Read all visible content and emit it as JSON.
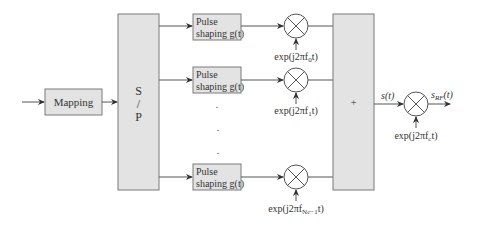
{
  "diagram": {
    "blocks": {
      "mapping": "Mapping",
      "sp": {
        "line1": "S",
        "line2": "/",
        "line3": "P"
      },
      "sum": "+"
    },
    "pulse_shaping": [
      {
        "line1": "Pulse",
        "line2": "shaping g(t)"
      },
      {
        "line1": "Pulse",
        "line2": "shaping g(t)"
      },
      {
        "line1": "Pulse",
        "line2": "shaping g(t)"
      }
    ],
    "carriers": [
      {
        "label": "exp(j2πf",
        "sub": "0",
        "tail": "t)"
      },
      {
        "label": "exp(j2πf",
        "sub": "1",
        "tail": "t)"
      },
      {
        "label": "exp(j2πf",
        "sub": "Nc−1",
        "tail": "t)"
      }
    ],
    "ellipsis": ".",
    "signal_labels": {
      "baseband": "s(t)",
      "rf": {
        "main": "s",
        "sub": "RF",
        "tail": "(t)"
      },
      "rf_carrier": {
        "label": "exp(j2πf",
        "sub": "c",
        "tail": "t)"
      }
    }
  }
}
